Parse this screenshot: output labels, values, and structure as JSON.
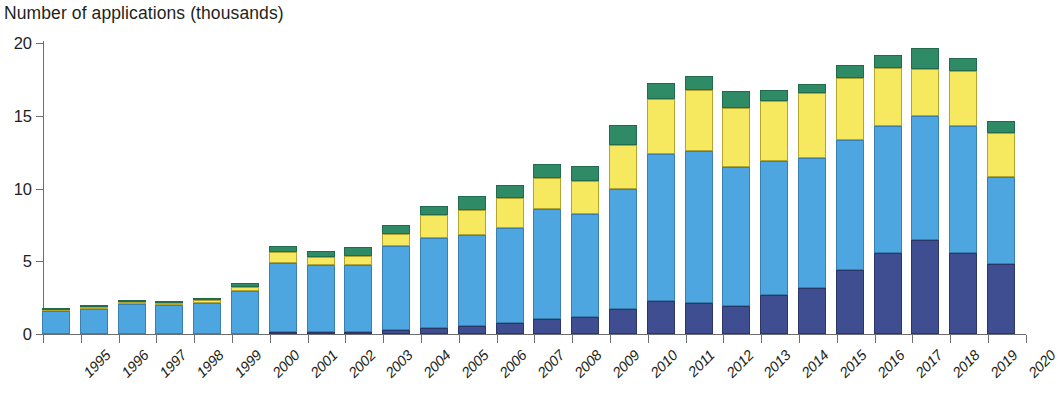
{
  "chart_data": {
    "type": "bar",
    "title": "Number of applications (thousands)",
    "xlabel": "",
    "ylabel": "Number of applications (thousands)",
    "ylim": [
      0,
      20
    ],
    "yticks": [
      0,
      5,
      10,
      15,
      20
    ],
    "grid": false,
    "legend": "none",
    "stacked": true,
    "categories": [
      "1995",
      "1996",
      "1997",
      "1998",
      "1999",
      "2000",
      "2001",
      "2002",
      "2003",
      "2004",
      "2005",
      "2006",
      "2007",
      "2008",
      "2009",
      "2010",
      "2011",
      "2012",
      "2013",
      "2014",
      "2015",
      "2016",
      "2017",
      "2018",
      "2019",
      "2020"
    ],
    "series": [
      {
        "name": "segment-1-navy",
        "color": "#3f4e91",
        "values": [
          0.0,
          0.0,
          0.0,
          0.0,
          0.0,
          0.0,
          0.12,
          0.12,
          0.15,
          0.25,
          0.4,
          0.55,
          0.75,
          1.05,
          1.2,
          1.75,
          2.25,
          2.15,
          1.95,
          2.7,
          3.15,
          4.4,
          5.55,
          6.45,
          5.55,
          4.8
        ]
      },
      {
        "name": "segment-2-light-blue",
        "color": "#4ea6e0",
        "values": [
          1.6,
          1.75,
          2.05,
          2.0,
          2.15,
          2.95,
          4.75,
          4.65,
          4.6,
          5.8,
          6.2,
          6.25,
          6.55,
          7.55,
          7.05,
          8.25,
          10.1,
          10.45,
          9.55,
          9.2,
          8.95,
          8.95,
          8.75,
          8.55,
          8.75,
          6.0
        ]
      },
      {
        "name": "segment-3-yellow",
        "color": "#f6e95f",
        "values": [
          0.08,
          0.1,
          0.12,
          0.12,
          0.2,
          0.3,
          0.75,
          0.55,
          0.6,
          0.85,
          1.55,
          1.75,
          2.05,
          2.15,
          2.25,
          3.0,
          3.8,
          4.2,
          4.05,
          4.1,
          4.45,
          4.25,
          4.0,
          3.2,
          3.8,
          3.0
        ]
      },
      {
        "name": "segment-4-green",
        "color": "#2f8a66",
        "values": [
          0.05,
          0.05,
          0.08,
          0.08,
          0.1,
          0.25,
          0.4,
          0.4,
          0.6,
          0.6,
          0.65,
          0.95,
          0.9,
          0.95,
          1.05,
          1.35,
          1.1,
          0.95,
          1.15,
          0.75,
          0.65,
          0.9,
          0.9,
          1.45,
          0.85,
          0.85
        ]
      }
    ],
    "totals": [
      1.73,
      1.9,
      2.25,
      2.2,
      2.45,
      3.5,
      6.02,
      5.72,
      5.9,
      7.5,
      8.8,
      9.5,
      10.25,
      11.7,
      11.55,
      14.35,
      17.25,
      17.75,
      16.7,
      16.75,
      17.2,
      18.5,
      19.2,
      19.65,
      18.95,
      14.65
    ]
  }
}
